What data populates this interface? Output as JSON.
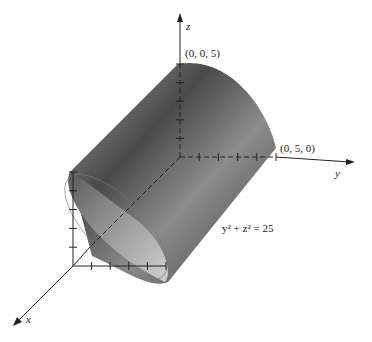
{
  "figure": {
    "type": "3d-surface-diagram",
    "surface": "cylinder",
    "equation": "y² + z² = 25",
    "axes": {
      "x": {
        "label": "x"
      },
      "y": {
        "label": "y"
      },
      "z": {
        "label": "z"
      }
    },
    "points": [
      {
        "label": "(0, 0, 5)"
      },
      {
        "label": "(0, 5, 0)"
      }
    ],
    "tick_count_per_axis": 5,
    "colors": {
      "axis": "#222222",
      "surface_dark": "#3a3a3a",
      "surface_light": "#d8d8d8"
    }
  }
}
